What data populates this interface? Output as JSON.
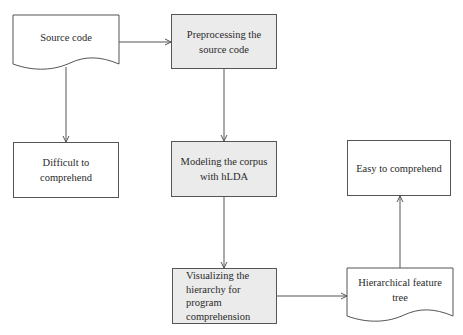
{
  "diagram": {
    "type": "flowchart",
    "nodes": {
      "source_code": {
        "label": "Source code",
        "shape": "document",
        "fill": "#ffffff"
      },
      "preprocessing": {
        "label": "Preprocessing the\nsource code",
        "shape": "rectangle",
        "fill": "#ebebeb"
      },
      "difficult": {
        "label": "Difficult to\ncomprehend",
        "shape": "rectangle",
        "fill": "#ffffff"
      },
      "modeling": {
        "label": "Modeling the corpus\nwith hLDA",
        "shape": "rectangle",
        "fill": "#ebebeb"
      },
      "easy": {
        "label": "Easy to comprehend",
        "shape": "rectangle",
        "fill": "#ffffff"
      },
      "visualizing": {
        "label": "Visualizing the\nhierarchy for\nprogram\ncomprehension",
        "shape": "rectangle",
        "fill": "#ebebeb"
      },
      "hierarchical_tree": {
        "label": "Hierarchical feature\ntree",
        "shape": "document",
        "fill": "#ffffff"
      }
    },
    "edges": [
      {
        "from": "source_code",
        "to": "preprocessing"
      },
      {
        "from": "source_code",
        "to": "difficult"
      },
      {
        "from": "preprocessing",
        "to": "modeling"
      },
      {
        "from": "modeling",
        "to": "visualizing"
      },
      {
        "from": "visualizing",
        "to": "hierarchical_tree"
      },
      {
        "from": "hierarchical_tree",
        "to": "easy"
      }
    ],
    "colors": {
      "line": "#555555",
      "gray_fill": "#ebebeb",
      "white_fill": "#ffffff"
    }
  }
}
